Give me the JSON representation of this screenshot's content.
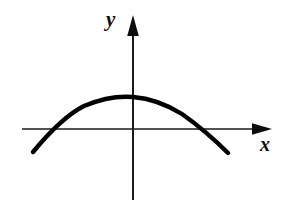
{
  "figure": {
    "background_color": "#ffffff",
    "width": 303,
    "height": 207
  },
  "axes": {
    "x_axis": {
      "label": "x",
      "icon": "arrow-right-icon",
      "color": "#1a1a1a",
      "line_y": 129,
      "line_start_x": 22,
      "line_end_x": 272,
      "stroke_width": 1.6
    },
    "y_axis": {
      "label": "y",
      "icon": "arrow-up-icon",
      "color": "#1a1a1a",
      "line_x": 133,
      "line_start_y": 15,
      "line_end_y": 200,
      "stroke_width": 2
    },
    "origin": {
      "x": 133,
      "y": 129
    }
  },
  "curve": {
    "name": "parabola",
    "shape": "downward-opening",
    "color": "#000000",
    "stroke_width": 4.4,
    "vertex": {
      "x": 133,
      "y": 97
    },
    "left_endpoint": {
      "x": 33,
      "y": 152
    },
    "right_endpoint": {
      "x": 228,
      "y": 153
    },
    "left_root_x": 60,
    "right_root_x": 202,
    "path": "M 33 152 Q 62 117 84 106 Q 110 95 133 97 Q 158 99 182 114 Q 206 131 228 153"
  },
  "chart_data": {
    "type": "line",
    "title": "",
    "xlabel": "x",
    "ylabel": "y",
    "grid": false,
    "legend": null,
    "curve_type": "parabola-downward",
    "vertex_on_y_axis": true,
    "x_intercepts": [
      -1,
      1
    ],
    "y_intercept": 1,
    "series": [
      {
        "name": "parabola",
        "x": [
          -1.45,
          -1.2,
          -1.0,
          -0.75,
          -0.5,
          -0.25,
          0,
          0.25,
          0.5,
          0.75,
          1.0,
          1.25,
          1.45
        ],
        "values": [
          -1.1,
          -0.44,
          0,
          0.44,
          0.75,
          0.94,
          1.0,
          0.94,
          0.75,
          0.44,
          0,
          -0.56,
          -1.1
        ]
      }
    ],
    "xlim": [
      -1.6,
      2.0
    ],
    "ylim": [
      -2.3,
      1.5
    ]
  }
}
